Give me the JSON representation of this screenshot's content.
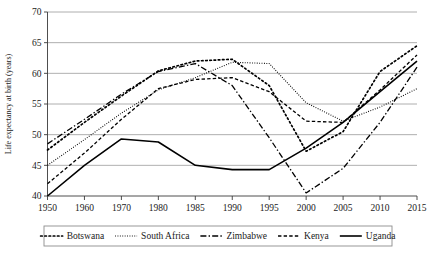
{
  "chart_data": {
    "type": "line",
    "title": "",
    "xlabel": "",
    "ylabel": "Life expectancy at birth (years)",
    "categories": [
      "1950",
      "1960",
      "1970",
      "1980",
      "1985",
      "1990",
      "1995",
      "2000",
      "2005",
      "2010",
      "2015"
    ],
    "ylim": [
      40,
      70
    ],
    "yticks": [
      40,
      45,
      50,
      55,
      60,
      65,
      70
    ],
    "ytick_labels": [
      "40",
      "45",
      "50",
      "55",
      "60",
      "65",
      "70"
    ],
    "grid": "horizontal",
    "legend_position": "below-axes",
    "series": [
      {
        "name": "Botswana",
        "style": "dotted",
        "dash": "1.6,2.6",
        "width": 1.7,
        "linecap": "round",
        "values": [
          47.5,
          52.0,
          56.3,
          60.4,
          62.0,
          62.3,
          58.0,
          47.3,
          50.5,
          60.3,
          64.5
        ]
      },
      {
        "name": "South Africa",
        "style": "fine-dotted",
        "dash": "0.9,1.5",
        "width": 1.1,
        "linecap": "butt",
        "values": [
          45.0,
          49.2,
          53.5,
          57.3,
          59.3,
          61.8,
          61.6,
          55.2,
          52.2,
          54.5,
          57.5
        ]
      },
      {
        "name": "Zimbabwe",
        "style": "dash-dot",
        "dash": "6,2.2,1.4,2.2",
        "width": 1.3,
        "linecap": "butt",
        "values": [
          48.5,
          52.5,
          56.6,
          60.3,
          61.6,
          58.0,
          49.5,
          40.5,
          44.5,
          52.0,
          61.0
        ]
      },
      {
        "name": "Kenya",
        "style": "dashed",
        "dash": "3.4,2.2",
        "width": 1.3,
        "linecap": "butt",
        "values": [
          42.0,
          47.0,
          52.5,
          57.5,
          59.0,
          59.3,
          57.0,
          52.2,
          52.0,
          57.3,
          63.0
        ]
      },
      {
        "name": "Uganda",
        "style": "solid",
        "dash": "",
        "width": 1.6,
        "linecap": "butt",
        "values": [
          40.0,
          45.0,
          49.3,
          48.8,
          45.0,
          44.3,
          44.3,
          47.8,
          52.0,
          57.0,
          62.0
        ]
      }
    ]
  },
  "legend": {
    "items": [
      {
        "label": "Botswana"
      },
      {
        "label": "South Africa"
      },
      {
        "label": "Zimbabwe"
      },
      {
        "label": "Kenya"
      },
      {
        "label": "Uganda"
      }
    ]
  }
}
